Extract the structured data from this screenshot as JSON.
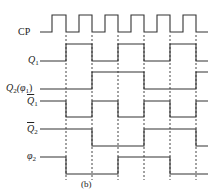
{
  "figure_label": "(b)",
  "signals": [
    {
      "id": "CP",
      "label": "CP",
      "y_low": 32,
      "y_high": 15
    },
    {
      "id": "Q1",
      "label": "Q",
      "sub": "1",
      "overline": false,
      "y_low": 61,
      "y_high": 44
    },
    {
      "id": "Q2",
      "label": "Q",
      "sub": "2",
      "suffix": "(φ",
      "suffix_sub": "1",
      "suffix_end": ")",
      "overline": false,
      "y_low": 89,
      "y_high": 72
    },
    {
      "id": "Q1bar",
      "label": "Q",
      "sub": "1",
      "overline": true,
      "y_low": 117,
      "y_high": 101
    },
    {
      "id": "Q2bar",
      "label": "Q",
      "sub": "2",
      "overline": true,
      "y_low": 146,
      "y_high": 129
    },
    {
      "id": "phi2",
      "label": "φ",
      "sub": "2",
      "overline": false,
      "y_low": 174,
      "y_high": 157
    }
  ],
  "clock_edges": {
    "rising": [
      52,
      79,
      105,
      131,
      157,
      183
    ],
    "falling": [
      66,
      92,
      118,
      144,
      170,
      196
    ]
  },
  "dashed_lines_x": [
    66,
    92,
    118,
    144,
    170,
    196
  ],
  "waveforms": {
    "Q1": {
      "start": "low",
      "toggles": [
        66,
        92,
        118,
        144,
        170,
        196
      ]
    },
    "Q2": {
      "start": "low",
      "toggles": [
        92,
        144,
        196
      ]
    },
    "Q1bar": {
      "start": "high",
      "toggles": [
        66,
        92,
        118,
        144,
        170,
        196
      ]
    },
    "Q2bar": {
      "start": "high",
      "toggles": [
        92,
        144,
        196
      ]
    },
    "phi2": {
      "start": "high",
      "toggles": [
        66,
        118,
        170
      ]
    }
  },
  "x_start": 40,
  "x_end": 208
}
